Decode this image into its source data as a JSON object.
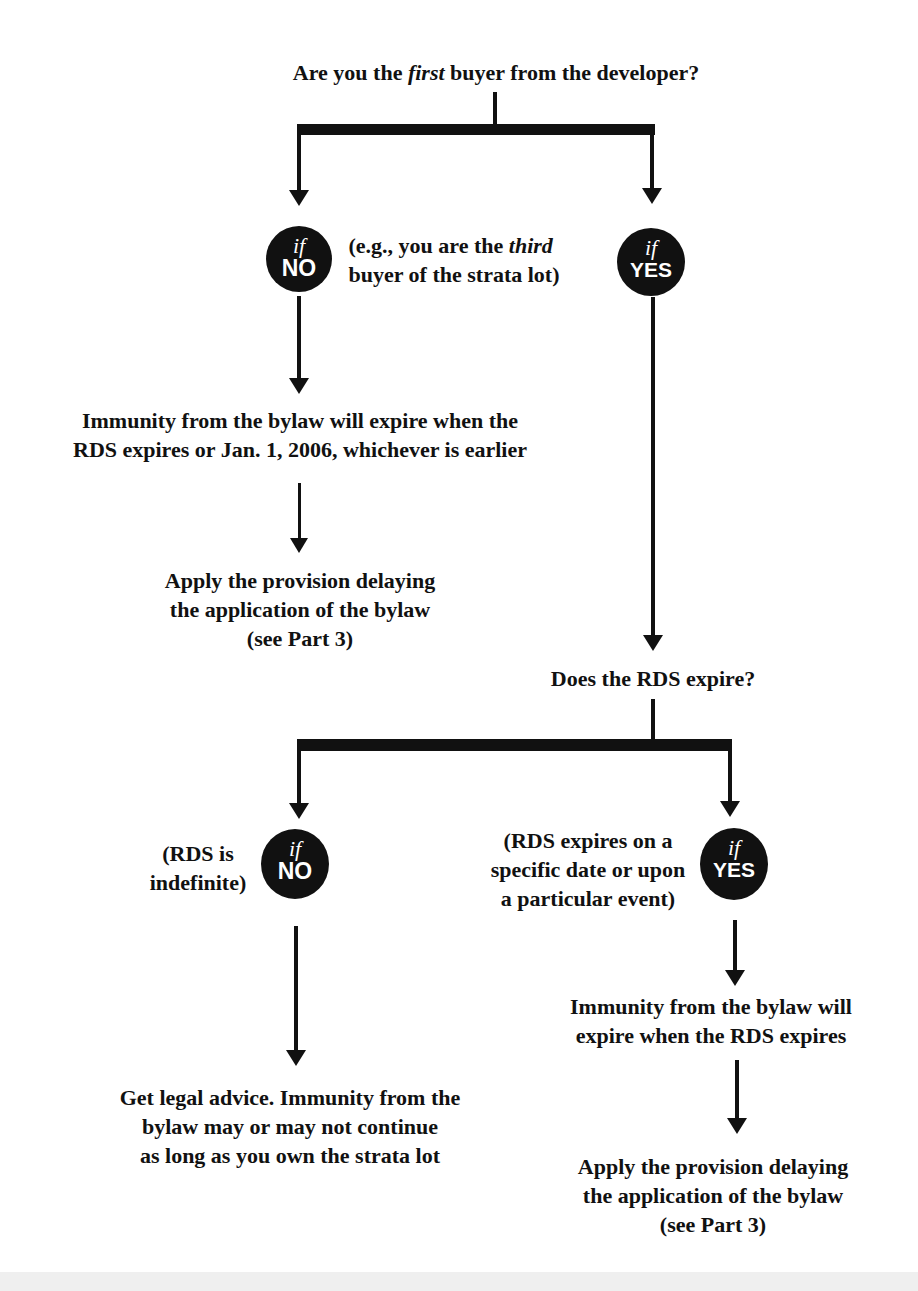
{
  "question1": {
    "prefix": "Are you the ",
    "emphasis": "first",
    "suffix": " buyer from the developer?"
  },
  "branch1": {
    "no": {
      "badge": {
        "if": "if",
        "word": "NO"
      },
      "note": {
        "line1_prefix": "(e.g., you are the ",
        "line1_emphasis": "third",
        "line2": "buyer of the strata lot)"
      },
      "result": {
        "line1": "Immunity from the bylaw will expire when the",
        "line2": "RDS expires or Jan. 1, 2006, whichever is earlier"
      },
      "action": {
        "line1": "Apply the provision delaying",
        "line2": "the application of the bylaw",
        "line3": "(see Part 3)"
      }
    },
    "yes": {
      "badge": {
        "if": "if",
        "word": "YES"
      }
    }
  },
  "question2": {
    "text": "Does the RDS expire?"
  },
  "branch2": {
    "no": {
      "badge": {
        "if": "if",
        "word": "NO"
      },
      "note": {
        "line1": "(RDS is",
        "line2": "indefinite)"
      },
      "result": {
        "line1": "Get legal advice. Immunity from the",
        "line2": "bylaw may or may not continue",
        "line3": "as long as you own the strata lot"
      }
    },
    "yes": {
      "badge": {
        "if": "if",
        "word": "YES"
      },
      "note": {
        "line1": "(RDS expires on a",
        "line2": "specific date or upon",
        "line3": "a particular event)"
      },
      "result": {
        "line1": "Immunity from the bylaw will",
        "line2": "expire when the RDS expires"
      },
      "action": {
        "line1": "Apply the provision delaying",
        "line2": "the application of the bylaw",
        "line3": "(see Part 3)"
      }
    }
  },
  "colors": {
    "ink": "#111111",
    "paper": "#ffffff",
    "badge_text": "#ffffff"
  }
}
